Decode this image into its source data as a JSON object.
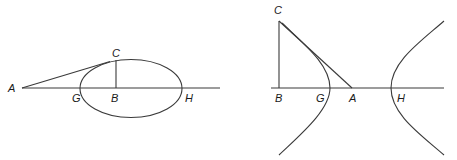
{
  "figures": [
    {
      "id": "ellipse-figure",
      "labels": {
        "A": "A",
        "C": "C",
        "G": "G",
        "B": "B",
        "H": "H"
      }
    },
    {
      "id": "hyperbola-figure",
      "labels": {
        "C": "C",
        "B": "B",
        "G": "G",
        "A": "A",
        "H": "H"
      }
    }
  ],
  "colors": {
    "line": "#3a3a3a",
    "text": "#1a1a1a",
    "background": "#ffffff"
  }
}
